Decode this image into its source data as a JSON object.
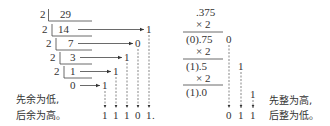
{
  "left": {
    "title": "Integer to binary: 29",
    "divisor": "2",
    "rows": [
      {
        "divisor": "2",
        "value": "29"
      },
      {
        "divisor": "2",
        "value": "14",
        "remainder": "1"
      },
      {
        "divisor": "2",
        "value": "7",
        "remainder": "0"
      },
      {
        "divisor": "2",
        "value": "3",
        "remainder": "1"
      },
      {
        "divisor": "2",
        "value": "1",
        "remainder": "1"
      },
      {
        "value": "0",
        "remainder": "1"
      }
    ],
    "note_line1": "先余为低,",
    "note_line2": "后余为高。",
    "result_digits": [
      "1",
      "1",
      "1",
      "0",
      "1",
      "."
    ]
  },
  "right": {
    "title": "Fraction to binary: .375",
    "steps": [
      {
        "top": ".375",
        "mult": "×  2"
      },
      {
        "top": "(0).75",
        "mult": "×  2",
        "bit": "0"
      },
      {
        "top": "(1).5",
        "mult": "× 2",
        "bit": "1"
      },
      {
        "top": "(1).0",
        "bit": "1"
      }
    ],
    "note_line1": "先整为高,",
    "note_line2": "后整为低。",
    "result_digits": [
      "0",
      "1",
      "1"
    ]
  }
}
